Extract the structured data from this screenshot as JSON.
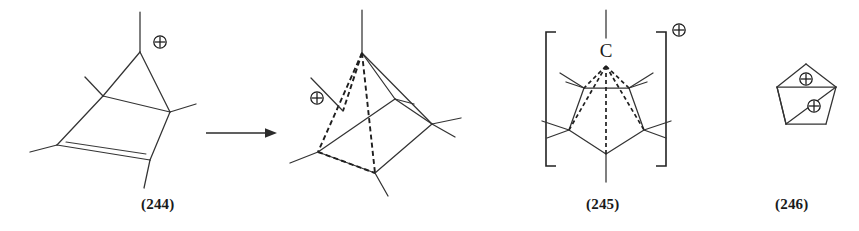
{
  "figure": {
    "type": "chemical-reaction-scheme",
    "background_color": "#ffffff",
    "line_color": "#333333"
  },
  "structures": [
    {
      "id": "244",
      "label": "(244)",
      "name": "bicyclic-carbocation-244",
      "description": "bicyclo[2.1.0] skeleton with cyclopropane ring fused to a cyclobutene bearing a C=C double bond, positive charge at apex methyl carbon",
      "charges": [
        {
          "symbol": "⊕",
          "name": "plus-charge-apex"
        }
      ],
      "features": [
        "cyclopropane-ring",
        "cyclobutene-ring",
        "double-bond",
        "four-methyl-substituents"
      ]
    },
    {
      "id": "245-intermediate",
      "label": "",
      "name": "pyramidal-cation-intermediate",
      "description": "square pyramidal cage cation drawn with dashed rear edges, positive charge to the left of the cage",
      "charges": [
        {
          "symbol": "⊕",
          "name": "plus-charge-left"
        }
      ],
      "features": [
        "dashed-rear-edges",
        "apex-vertex",
        "quadrilateral-base",
        "methyl-substituents"
      ]
    },
    {
      "id": "245",
      "label": "(245)",
      "name": "pentagonal-pyramidal-cation-245",
      "description": "bracketed pentagonal pyramidal carbocation with apex carbon labelled C connected by dashed bonds to the five basal carbons",
      "apex_atom": "C",
      "bracket": {
        "left": "[",
        "right": "]"
      },
      "charges": [
        {
          "symbol": "⊕",
          "name": "plus-charge-bracket-superscript"
        }
      ],
      "features": [
        "square-bracket-enclosure",
        "apex-carbon-label",
        "five-dashed-bonds",
        "pentagon-base",
        "five-methyl-substituents"
      ]
    },
    {
      "id": "246",
      "label": "(246)",
      "name": "pentagonal-dication-246",
      "description": "pentagon outline with two internal bonds delineating a triangle and a quadrilateral, bearing two positive charges",
      "charges": [
        {
          "symbol": "⊕",
          "name": "plus-charge-upper"
        },
        {
          "symbol": "⊕",
          "name": "plus-charge-lower"
        }
      ],
      "features": [
        "pentagon-outline",
        "internal-chord",
        "internal-diagonal",
        "two-plus-charges"
      ]
    }
  ],
  "arrow": {
    "name": "reaction-arrow",
    "direction": "right",
    "symbol": "→"
  },
  "charge_symbol": "⊕",
  "atom_labels": {
    "apex_carbon": "C"
  },
  "captions": {
    "c244": "(244)",
    "c245": "(245)",
    "c246": "(246)"
  }
}
